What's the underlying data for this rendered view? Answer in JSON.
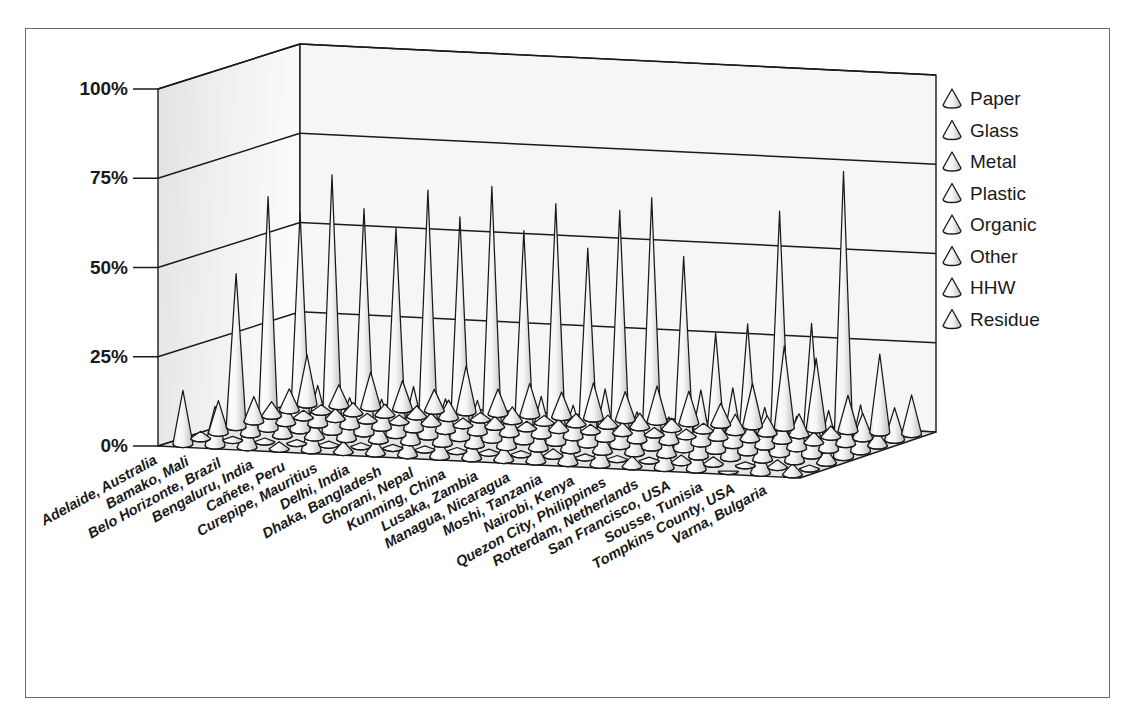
{
  "figure": {
    "background": "#ffffff",
    "border_color": "#6e6e6e",
    "ink_color": "#1a1a1a",
    "cone_fill_light": "#fdfdfd",
    "cone_fill_shade": "#d6d6d6",
    "wall_fill": "#eeeeee",
    "floor_fill": "#e6e6e6"
  },
  "chart_data": {
    "type": "bar",
    "subtype": "3d-cone",
    "title": "",
    "subtitle": "",
    "xlabel": "",
    "ylabel": "",
    "zlabel": "",
    "grid": true,
    "legend_position": "right",
    "ylim": [
      0,
      100
    ],
    "yticks": [
      0,
      25,
      50,
      75,
      100
    ],
    "ytick_labels": [
      "0%",
      "25%",
      "50%",
      "75%",
      "100%"
    ],
    "categories": [
      "Adelaide, Australia",
      "Bamako, Mali",
      "Belo Horizonte, Brazil",
      "Bengaluru, India",
      "Cañete, Peru",
      "Curepipe, Mauritius",
      "Delhi, India",
      "Dhaka, Bangladesh",
      "Ghorani, Nepal",
      "Kunming, China",
      "Lusaka, Zambia",
      "Managua, Nicaragua",
      "Moshi, Tanzania",
      "Nairobi, Kenya",
      "Quezon City, Philippines",
      "Rotterdam, Netherlands",
      "San Francisco, USA",
      "Sousse, Tunisia",
      "Tompkins County, USA",
      "Varna, Bulgaria"
    ],
    "series": [
      {
        "name": "Paper",
        "values": [
          14,
          6,
          10,
          8,
          6,
          13,
          7,
          9,
          7,
          10,
          8,
          10,
          9,
          6,
          12,
          23,
          20,
          10,
          22,
          11
        ]
      },
      {
        "name": "Glass",
        "values": [
          6,
          2,
          3,
          3,
          3,
          5,
          2,
          4,
          2,
          3,
          3,
          4,
          3,
          2,
          5,
          5,
          6,
          3,
          7,
          9
        ]
      },
      {
        "name": "Metal",
        "values": [
          4,
          2,
          3,
          2,
          2,
          3,
          2,
          3,
          2,
          3,
          2,
          3,
          2,
          2,
          4,
          4,
          5,
          3,
          6,
          4
        ]
      },
      {
        "name": "Plastic",
        "values": [
          7,
          5,
          11,
          8,
          8,
          12,
          9,
          9,
          6,
          11,
          9,
          14,
          8,
          7,
          15,
          16,
          11,
          9,
          11,
          13
        ]
      },
      {
        "name": "Organic",
        "values": [
          43,
          65,
          61,
          72,
          63,
          58,
          69,
          62,
          71,
          59,
          67,
          55,
          66,
          70,
          54,
          33,
          36,
          68,
          37,
          80
        ]
      },
      {
        "name": "Other",
        "values": [
          9,
          8,
          5,
          4,
          9,
          5,
          6,
          7,
          6,
          8,
          6,
          7,
          5,
          6,
          6,
          10,
          13,
          6,
          9,
          4
        ]
      },
      {
        "name": "HHW",
        "values": [
          2,
          1,
          1,
          1,
          1,
          1,
          1,
          1,
          1,
          1,
          1,
          2,
          1,
          1,
          1,
          2,
          2,
          1,
          2,
          1
        ]
      },
      {
        "name": "Residue",
        "values": [
          15,
          11,
          6,
          2,
          8,
          3,
          4,
          5,
          5,
          5,
          4,
          5,
          6,
          6,
          3,
          7,
          7,
          0,
          6,
          3
        ]
      }
    ]
  },
  "legend": {
    "marker": "cone-icon",
    "entries": [
      {
        "label": "Paper"
      },
      {
        "label": "Glass"
      },
      {
        "label": "Metal"
      },
      {
        "label": "Plastic"
      },
      {
        "label": "Organic"
      },
      {
        "label": "Other"
      },
      {
        "label": "HHW"
      },
      {
        "label": "Residue"
      }
    ]
  },
  "geometry": {
    "floor_front_left": [
      158,
      446
    ],
    "floor_back_left": [
      300,
      401
    ],
    "floor_back_right": [
      936,
      432
    ],
    "floor_front_right": [
      800,
      478
    ],
    "wall_height_px": 357,
    "tick_x": 133,
    "axis_label_right": 128
  }
}
